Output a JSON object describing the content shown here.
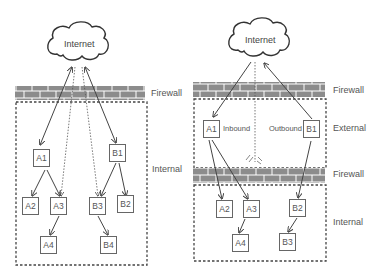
{
  "left_diagram": {
    "cloud": {
      "label": "Internet"
    },
    "zones": {
      "firewall": "Firewall",
      "internal": "Internal"
    },
    "nodes": {
      "A1": "A1",
      "A2": "A2",
      "A3": "A3",
      "A4": "A4",
      "B1": "B1",
      "B2": "B2",
      "B3": "B3",
      "B4": "B4"
    },
    "edges": [
      {
        "from": "Internet",
        "to": "A1",
        "style": "solid"
      },
      {
        "from": "Internet",
        "to": "B1",
        "style": "solid"
      },
      {
        "from": "Internet",
        "to": "A3",
        "style": "dotted"
      },
      {
        "from": "Internet",
        "to": "B3",
        "style": "dotted"
      },
      {
        "from": "A1",
        "to": "A2",
        "style": "solid"
      },
      {
        "from": "A1",
        "to": "A3",
        "style": "solid"
      },
      {
        "from": "A3",
        "to": "A4",
        "style": "solid"
      },
      {
        "from": "B1",
        "to": "B3",
        "style": "solid"
      },
      {
        "from": "B1",
        "to": "B2",
        "style": "solid"
      },
      {
        "from": "B3",
        "to": "B4",
        "style": "solid"
      }
    ]
  },
  "right_diagram": {
    "cloud": {
      "label": "Internet"
    },
    "zones": {
      "firewall_top": "Firewall",
      "external": "External",
      "firewall_mid": "Firewall",
      "internal": "Internal"
    },
    "flow_labels": {
      "inbound": "Inbound",
      "outbound": "Outbound"
    },
    "nodes": {
      "A1": "A1",
      "A2": "A2",
      "A3": "A3",
      "A4": "A4",
      "B1": "B1",
      "B2": "B2",
      "B3": "B3"
    },
    "edges": [
      {
        "from": "Internet",
        "to": "A1",
        "style": "solid"
      },
      {
        "from": "B1",
        "to": "Internet",
        "style": "solid"
      },
      {
        "from": "Internet",
        "to": "Firewall",
        "style": "dotted",
        "blocked": true
      },
      {
        "from": "A1",
        "to": "A2",
        "style": "solid"
      },
      {
        "from": "A1",
        "to": "A3",
        "style": "solid"
      },
      {
        "from": "A3",
        "to": "A4",
        "style": "solid"
      },
      {
        "from": "B1",
        "to": "B2",
        "style": "solid"
      },
      {
        "from": "B2",
        "to": "B3",
        "style": "solid"
      }
    ]
  },
  "colors": {
    "brick": "#8a8a8a",
    "line": "#444444",
    "box_border": "#666666",
    "text": "#555555"
  }
}
